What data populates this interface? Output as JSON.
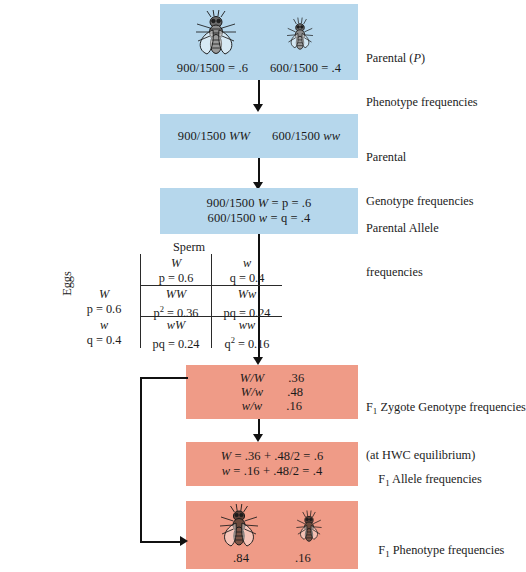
{
  "diagram": {
    "colors": {
      "blue_box": "#b6d7ec",
      "salmon_box": "#ef9b87",
      "arrow": "#111111"
    }
  },
  "boxes": {
    "parental_phenotype": {
      "freq_left": "900/1500 = .6",
      "freq_right": "600/1500 = .4",
      "label_line1": "Parental (P)",
      "label_line2": "Phenotype frequencies"
    },
    "parental_genotype": {
      "left_num": "900/1500 ",
      "left_geno": "WW",
      "right_num": "600/1500 ",
      "right_geno": "ww",
      "label_line1": "Parental",
      "label_line2": "Genotype frequencies"
    },
    "parental_allele": {
      "line1_num": "900/1500 ",
      "line1_allele": "W",
      "line1_rest": " = p = .6",
      "line2_num": "600/1500 ",
      "line2_allele": "w",
      "line2_rest": " = q = .4",
      "label_line1": "Parental Allele",
      "label_line2": "frequencies"
    },
    "f1_zygote": {
      "rows": [
        {
          "genotype": "W/W",
          "value": ".36"
        },
        {
          "genotype": "W/w",
          "value": ".48"
        },
        {
          "genotype": "w/w",
          "value": ".16"
        }
      ],
      "label_line1_pre": "F",
      "label_line1_sub": "1",
      "label_line1_post": " Zygote Genotype frequencies",
      "label_line2": "(at HWC equilibrium)"
    },
    "f1_allele": {
      "line1_allele": "W",
      "line1_rest": " = .36 + .48/2 = .6",
      "line2_allele": "w",
      "line2_rest": " = .16 + .48/2 = .4",
      "label_pre": "F",
      "label_sub": "1",
      "label_post": " Allele frequencies"
    },
    "f1_phenotype": {
      "value_left": ".84",
      "value_right": ".16",
      "label_pre": "F",
      "label_sub": "1",
      "label_post": " Phenotype frequencies"
    }
  },
  "punnett": {
    "title": "Sperm",
    "side_title": "Eggs",
    "col_headers": [
      {
        "allele": "W",
        "freq": "p = 0.6"
      },
      {
        "allele": "w",
        "freq": "q = 0.4"
      }
    ],
    "row_headers": [
      {
        "allele": "W",
        "freq": "p = 0.6"
      },
      {
        "allele": "w",
        "freq": "q = 0.4"
      }
    ],
    "cells": [
      {
        "genotype": "WW",
        "expr_base": "p",
        "expr_exp": "2",
        "expr_rest": " = 0.36"
      },
      {
        "genotype": "Ww",
        "expr_base": "pq",
        "expr_exp": "",
        "expr_rest": " = 0.24"
      },
      {
        "genotype": "wW",
        "expr_base": "pq",
        "expr_exp": "",
        "expr_rest": " = 0.24"
      },
      {
        "genotype": "ww",
        "expr_base": "q",
        "expr_exp": "2",
        "expr_rest": " = 0.16"
      }
    ]
  }
}
